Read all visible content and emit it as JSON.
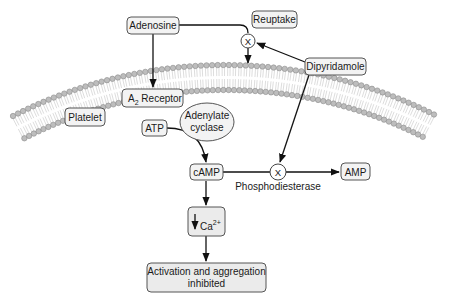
{
  "diagram": {
    "nodes": {
      "adenosine": "Adenosine",
      "reuptake": "Reuptake",
      "dipyridamole": "Dipyridamole",
      "a2_receptor_main": "A",
      "a2_receptor_sub": "2",
      "a2_receptor_rest": " Receptor",
      "platelet": "Platelet",
      "atp": "ATP",
      "adenylate_cyclase_line1": "Adenylate",
      "adenylate_cyclase_line2": "cyclase",
      "camp": "cAMP",
      "amp": "AMP",
      "phosphodiesterase": "Phosphodiesterase",
      "calcium_main": "Ca",
      "calcium_sup": "2+",
      "outcome_line1": "Activation and aggregation",
      "outcome_line2": "inhibited"
    },
    "blockers": {
      "reuptake_block": "X",
      "pde_block": "X"
    },
    "edges": [
      {
        "from": "Adenosine",
        "to": "A2 Receptor",
        "type": "arrow"
      },
      {
        "from": "Adenosine",
        "to": "Reuptake",
        "type": "line"
      },
      {
        "from": "Reuptake",
        "to": "membrane",
        "type": "arrow",
        "blocked_by": "Dipyridamole"
      },
      {
        "from": "Dipyridamole",
        "to": "reuptake_block",
        "type": "arrow"
      },
      {
        "from": "Dipyridamole",
        "to": "pde_block",
        "type": "arrow"
      },
      {
        "from": "ATP",
        "to": "cAMP",
        "type": "arrow",
        "via": "Adenylate cyclase"
      },
      {
        "from": "cAMP",
        "to": "AMP",
        "type": "arrow",
        "via": "Phosphodiesterase",
        "blocked_by": "Dipyridamole"
      },
      {
        "from": "cAMP",
        "to": "Ca2+ decrease",
        "type": "arrow"
      },
      {
        "from": "Ca2+ decrease",
        "to": "Activation and aggregation inhibited",
        "type": "arrow"
      }
    ],
    "colors": {
      "box_fill": "#f3f3f3",
      "box_stroke": "#555555",
      "membrane_head": "#bdbdbd",
      "line": "#111111"
    }
  }
}
